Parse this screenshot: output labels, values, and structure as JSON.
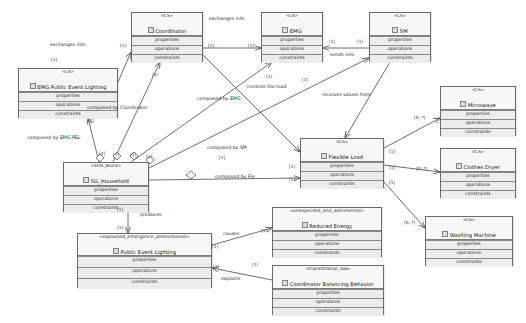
{
  "diagram": {
    "type": "uml-class-diagram",
    "colors": {
      "box_fill": "#f2f2f2",
      "header_fill": "#f7f7f7",
      "row_fill": "#ececec",
      "border": "#6b6b6b",
      "edge": "#4a4a4a",
      "text": "#1a1a1a"
    },
    "compartment_labels": {
      "properties": "properties",
      "operations": "operations",
      "constraints": "constraints"
    },
    "classes": [
      {
        "id": "coordinator",
        "stereotype": "«CS»",
        "name": "Coordinator",
        "icon": "block-icon",
        "x": 131,
        "y": 12,
        "w": 72,
        "h": 50
      },
      {
        "id": "emg",
        "stereotype": "«CS»",
        "name": "EMG",
        "icon": "block-icon",
        "x": 261,
        "y": 12,
        "w": 62,
        "h": 50
      },
      {
        "id": "sm",
        "stereotype": "«CS»",
        "name": "SM",
        "icon": "block-icon",
        "x": 369,
        "y": 12,
        "w": 62,
        "h": 50
      },
      {
        "id": "emg_public_event_lighting",
        "stereotype": "«CS»",
        "name": "EMG Public Event Lighting",
        "icon": "block-icon",
        "x": 18,
        "y": 68,
        "w": 100,
        "h": 50
      },
      {
        "id": "sg_household",
        "stereotype": "«SOS_Block»",
        "name": "SG_Household",
        "icon": "block-icon",
        "x": 63,
        "y": 162,
        "w": 86,
        "h": 50
      },
      {
        "id": "flexible_load",
        "stereotype": "«CS»",
        "name": "Flexible Load",
        "icon": "block-icon",
        "x": 300,
        "y": 138,
        "w": 84,
        "h": 50
      },
      {
        "id": "microwave",
        "stereotype": "«CS»",
        "name": "Microwave",
        "icon": "block-icon",
        "x": 440,
        "y": 86,
        "w": 76,
        "h": 50
      },
      {
        "id": "clothes_dryer",
        "stereotype": "«CS»",
        "name": "Clothes Dryer",
        "icon": "block-icon",
        "x": 440,
        "y": 148,
        "w": 76,
        "h": 50
      },
      {
        "id": "washing_machine",
        "stereotype": "«CS»",
        "name": "Washing Machine",
        "icon": "block-icon",
        "x": 425,
        "y": 216,
        "w": 88,
        "h": 50
      },
      {
        "id": "public_event_lighting",
        "stereotype": "«explained_emergence_phenomenon»",
        "name": "Public Event Lighting",
        "icon": "block-icon",
        "x": 77,
        "y": 233,
        "w": 135,
        "h": 55
      },
      {
        "id": "reduced_energy",
        "stereotype": "«unexpected_and_detrimental»",
        "name": "Reduced Energy",
        "icon": "block-icon",
        "x": 272,
        "y": 207,
        "w": 110,
        "h": 50
      },
      {
        "id": "coordinator_balancing",
        "stereotype": "«transOrdinal_law»",
        "name": "Coordinator Balancing Behavior",
        "icon": "block-icon",
        "x": 272,
        "y": 265,
        "w": 112,
        "h": 50
      }
    ],
    "edge_labels": [
      {
        "id": "exchanges-info-left",
        "text": "exchanges info",
        "x": 50,
        "y": 43
      },
      {
        "id": "exchanges-info-right",
        "text": "exchanges info",
        "x": 209,
        "y": 17
      },
      {
        "id": "sends-info",
        "text": "sends info",
        "x": 330,
        "y": 53
      },
      {
        "id": "controls-the-load",
        "text": "controls the load",
        "x": 247,
        "y": 85
      },
      {
        "id": "receives-values-from",
        "text": "receives values from",
        "x": 322,
        "y": 93
      },
      {
        "id": "composed-by-coordinator",
        "text": "composed by Coordinator",
        "x": 87,
        "y": 106
      },
      {
        "id": "composed-by-emg",
        "text": "composed by EMG",
        "x": 197,
        "y": 97
      },
      {
        "id": "composed-by-emg-pel",
        "text": "composed by EMG PEL",
        "x": 27,
        "y": 136
      },
      {
        "id": "composed-by-sm",
        "text": "composed by SM",
        "x": 207,
        "y": 146
      },
      {
        "id": "composed-by-fle",
        "text": "composed by Fle",
        "x": 215,
        "y": 175
      },
      {
        "id": "produces",
        "text": "produces",
        "x": 140,
        "y": 213
      },
      {
        "id": "causes",
        "text": "causes",
        "x": 223,
        "y": 232
      },
      {
        "id": "explains",
        "text": "explains",
        "x": 221,
        "y": 277
      }
    ],
    "multiplicities": [
      {
        "id": "m-coord-left",
        "text": "[1]",
        "x": 120,
        "y": 44
      },
      {
        "id": "m-exch-left-low",
        "text": "[1]",
        "x": 51,
        "y": 58
      },
      {
        "id": "m-coord-right",
        "text": "[1]",
        "x": 208,
        "y": 44
      },
      {
        "id": "m-emg-left",
        "text": "[1]",
        "x": 248,
        "y": 44
      },
      {
        "id": "m-emg-right",
        "text": "[1]",
        "x": 329,
        "y": 40
      },
      {
        "id": "m-sm-left",
        "text": "[1]",
        "x": 357,
        "y": 40
      },
      {
        "id": "m-coord-bottom",
        "text": "[1]",
        "x": 152,
        "y": 73
      },
      {
        "id": "m-emg-bottom",
        "text": "[1]",
        "x": 266,
        "y": 75
      },
      {
        "id": "m-pel-bottom",
        "text": "[1]",
        "x": 88,
        "y": 119
      },
      {
        "id": "m-sm-down",
        "text": "[1]",
        "x": 302,
        "y": 78
      },
      {
        "id": "m-house-top-a",
        "text": "[4]",
        "x": 99,
        "y": 152
      },
      {
        "id": "m-house-top-b",
        "text": "[1]",
        "x": 113,
        "y": 153
      },
      {
        "id": "m-house-top-c",
        "text": "[1]",
        "x": 130,
        "y": 153
      },
      {
        "id": "m-house-top-d",
        "text": "[1]",
        "x": 146,
        "y": 155
      },
      {
        "id": "m-sm-mult",
        "text": "[1]",
        "x": 219,
        "y": 156
      },
      {
        "id": "m-fle-left",
        "text": "[1]",
        "x": 289,
        "y": 178
      },
      {
        "id": "m-fle-in",
        "text": "[1]",
        "x": 289,
        "y": 165
      },
      {
        "id": "m-micro",
        "text": "[0..*]",
        "x": 414,
        "y": 116
      },
      {
        "id": "m-dryer",
        "text": "[0..*]",
        "x": 416,
        "y": 167
      },
      {
        "id": "m-washer",
        "text": "[0..*]",
        "x": 404,
        "y": 221
      },
      {
        "id": "m-fl-right-a",
        "text": "[1]",
        "x": 389,
        "y": 150
      },
      {
        "id": "m-fl-right-b",
        "text": "[1]",
        "x": 389,
        "y": 166
      },
      {
        "id": "m-fl-right-c",
        "text": "[1]",
        "x": 389,
        "y": 181
      },
      {
        "id": "m-house-prod",
        "text": "[1]",
        "x": 117,
        "y": 208
      },
      {
        "id": "m-prod-end",
        "text": "[1]",
        "x": 117,
        "y": 226
      },
      {
        "id": "m-causes-a",
        "text": "[1]",
        "x": 212,
        "y": 245
      },
      {
        "id": "m-causes-b",
        "text": "[1]",
        "x": 261,
        "y": 229
      },
      {
        "id": "m-explains-a",
        "text": "[1]",
        "x": 213,
        "y": 265
      },
      {
        "id": "m-explains-b",
        "text": "[1]",
        "x": 252,
        "y": 263
      }
    ]
  }
}
